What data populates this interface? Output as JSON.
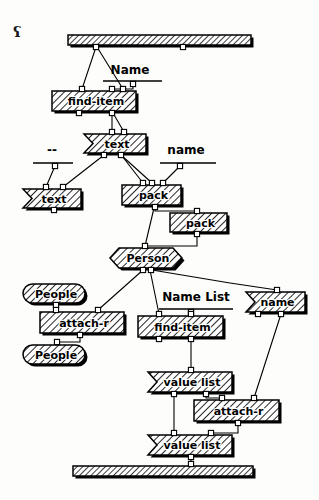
{
  "canvas": {
    "width": 319,
    "height": 500,
    "background": "#fdfdfb",
    "ink": "#000000",
    "corner_mark": "ʕ"
  },
  "diagram": {
    "kind": "visual-dataflow-program",
    "title": "",
    "bars": [
      {
        "id": "top-bar",
        "name": "input-terminal-bar",
        "x": 68,
        "y": 35,
        "w": 183,
        "h": 10
      },
      {
        "id": "bottom-bar",
        "name": "output-terminal-bar",
        "x": 73,
        "y": 466,
        "w": 180,
        "h": 10
      }
    ],
    "nodes": [
      {
        "id": "find-item-1",
        "label": "find-item",
        "shape": "rect",
        "x": 52,
        "y": 91,
        "w": 84,
        "h": 20,
        "font": 11
      },
      {
        "id": "text-1",
        "label": "text",
        "shape": "banner",
        "x": 84,
        "y": 134,
        "w": 62,
        "h": 19,
        "font": 11
      },
      {
        "id": "text-2",
        "label": "text",
        "shape": "banner",
        "x": 23,
        "y": 189,
        "w": 58,
        "h": 19,
        "font": 11
      },
      {
        "id": "pack-1",
        "label": "pack",
        "shape": "rect",
        "x": 122,
        "y": 185,
        "w": 59,
        "h": 20,
        "font": 11
      },
      {
        "id": "pack-2",
        "label": "pack",
        "shape": "rect",
        "x": 170,
        "y": 213,
        "w": 57,
        "h": 19,
        "font": 11
      },
      {
        "id": "person",
        "label": "Person",
        "shape": "hexagon",
        "x": 110,
        "y": 248,
        "w": 72,
        "h": 20,
        "font": 11
      },
      {
        "id": "people-1",
        "label": "People",
        "shape": "oval",
        "x": 23,
        "y": 284,
        "w": 62,
        "h": 19,
        "font": 11
      },
      {
        "id": "attach-r-1",
        "label": "attach-r",
        "shape": "rect",
        "x": 40,
        "y": 312,
        "w": 84,
        "h": 21,
        "font": 11
      },
      {
        "id": "people-2",
        "label": "People",
        "shape": "oval",
        "x": 23,
        "y": 345,
        "w": 62,
        "h": 19,
        "font": 11
      },
      {
        "id": "name-banner",
        "label": "name",
        "shape": "banner",
        "x": 246,
        "y": 292,
        "w": 59,
        "h": 20,
        "font": 11
      },
      {
        "id": "find-item-2",
        "label": "find-item",
        "shape": "rect",
        "x": 138,
        "y": 316,
        "w": 85,
        "h": 21,
        "font": 11
      },
      {
        "id": "value-list-1",
        "label": "value list",
        "shape": "banner",
        "x": 148,
        "y": 372,
        "w": 84,
        "h": 20,
        "font": 11
      },
      {
        "id": "attach-r-2",
        "label": "attach-r",
        "shape": "rect",
        "x": 194,
        "y": 400,
        "w": 85,
        "h": 21,
        "font": 11
      },
      {
        "id": "value-list-2",
        "label": "value list",
        "shape": "banner",
        "x": 148,
        "y": 435,
        "w": 84,
        "h": 20,
        "font": 11
      }
    ],
    "labels": [
      {
        "id": "label-name",
        "text": "Name",
        "x": 130,
        "y": 70,
        "font": 12,
        "rule": {
          "x1": 103,
          "y1": 81,
          "x2": 162,
          "y2": 81
        }
      },
      {
        "id": "label-dashdash",
        "text": "--",
        "x": 52,
        "y": 150,
        "font": 12,
        "rule": {
          "x1": 33,
          "y1": 163,
          "x2": 73,
          "y2": 163
        }
      },
      {
        "id": "label-name-low",
        "text": "name",
        "x": 186,
        "y": 150,
        "font": 12,
        "rule": {
          "x1": 160,
          "y1": 163,
          "x2": 216,
          "y2": 163
        }
      },
      {
        "id": "label-name-list",
        "text": "Name List",
        "x": 196,
        "y": 297,
        "font": 12,
        "rule": {
          "x1": 159,
          "y1": 309,
          "x2": 233,
          "y2": 309
        }
      }
    ],
    "ports": [
      {
        "id": "p-topbar-a",
        "x": 96,
        "y": 47
      },
      {
        "id": "p-topbar-b",
        "x": 183,
        "y": 47
      },
      {
        "id": "p-namerule",
        "x": 133,
        "y": 84
      },
      {
        "id": "p-fi1-in-a",
        "x": 82,
        "y": 89
      },
      {
        "id": "p-fi1-in-b",
        "x": 112,
        "y": 89
      },
      {
        "id": "p-fi1-in-c",
        "x": 123,
        "y": 89
      },
      {
        "id": "p-fi1-out-a",
        "x": 79,
        "y": 113
      },
      {
        "id": "p-fi1-out-b",
        "x": 112,
        "y": 113
      },
      {
        "id": "p-txt1-in-a",
        "x": 112,
        "y": 132
      },
      {
        "id": "p-txt1-in-b",
        "x": 124,
        "y": 132
      },
      {
        "id": "p-txt1-out-a",
        "x": 104,
        "y": 155
      },
      {
        "id": "p-txt1-out-b",
        "x": 121,
        "y": 155
      },
      {
        "id": "p-dash-rule",
        "x": 55,
        "y": 166
      },
      {
        "id": "p-name-rule",
        "x": 180,
        "y": 166
      },
      {
        "id": "p-txt2-in-a",
        "x": 46,
        "y": 187
      },
      {
        "id": "p-txt2-in-b",
        "x": 63,
        "y": 187
      },
      {
        "id": "p-txt2-out",
        "x": 54,
        "y": 210
      },
      {
        "id": "p-pack1-in-a",
        "x": 143,
        "y": 183
      },
      {
        "id": "p-pack1-in-b",
        "x": 152,
        "y": 183
      },
      {
        "id": "p-pack1-in-c",
        "x": 163,
        "y": 183
      },
      {
        "id": "p-pack1-out",
        "x": 155,
        "y": 207
      },
      {
        "id": "p-pack2-in",
        "x": 197,
        "y": 211
      },
      {
        "id": "p-pack2-out",
        "x": 197,
        "y": 234
      },
      {
        "id": "p-person-in",
        "x": 145,
        "y": 246
      },
      {
        "id": "p-person-o-a",
        "x": 143,
        "y": 270
      },
      {
        "id": "p-person-o-b",
        "x": 151,
        "y": 270
      },
      {
        "id": "p-people1-out",
        "x": 56,
        "y": 305
      },
      {
        "id": "p-ar1-in-a",
        "x": 56,
        "y": 310
      },
      {
        "id": "p-ar1-in-b",
        "x": 98,
        "y": 310
      },
      {
        "id": "p-ar1-out",
        "x": 80,
        "y": 335
      },
      {
        "id": "p-people2-in",
        "x": 57,
        "y": 342
      },
      {
        "id": "p-nl-rule",
        "x": 191,
        "y": 312
      },
      {
        "id": "p-fi2-in-a",
        "x": 159,
        "y": 314
      },
      {
        "id": "p-fi2-in-b",
        "x": 191,
        "y": 314
      },
      {
        "id": "p-fi2-out-a",
        "x": 159,
        "y": 339
      },
      {
        "id": "p-fi2-out-b",
        "x": 191,
        "y": 339
      },
      {
        "id": "p-nm-in",
        "x": 277,
        "y": 290
      },
      {
        "id": "p-nm-out-a",
        "x": 258,
        "y": 314
      },
      {
        "id": "p-nm-out-b",
        "x": 281,
        "y": 314
      },
      {
        "id": "p-vl1-in",
        "x": 191,
        "y": 370
      },
      {
        "id": "p-vl1-out-a",
        "x": 174,
        "y": 394
      },
      {
        "id": "p-vl1-out-b",
        "x": 206,
        "y": 394
      },
      {
        "id": "p-ar2-in-a",
        "x": 222,
        "y": 398
      },
      {
        "id": "p-ar2-in-b",
        "x": 254,
        "y": 398
      },
      {
        "id": "p-ar2-out",
        "x": 238,
        "y": 423
      },
      {
        "id": "p-vl2-in-a",
        "x": 174,
        "y": 433
      },
      {
        "id": "p-vl2-in-b",
        "x": 211,
        "y": 433
      },
      {
        "id": "p-vl2-out",
        "x": 191,
        "y": 457
      },
      {
        "id": "p-botbar",
        "x": 191,
        "y": 464
      }
    ],
    "wires": [
      {
        "id": "w1",
        "from": "p-topbar-a",
        "to": "p-fi1-in-a",
        "path": "M96,47 L82,89"
      },
      {
        "id": "w2",
        "from": "p-topbar-a",
        "to": "p-fi1-in-c",
        "path": "M97,47 L123,89"
      },
      {
        "id": "w3",
        "from": "p-namerule",
        "to": "p-fi1-in-b",
        "path": "M133,84 L133,89 L112,89"
      },
      {
        "id": "w4",
        "from": "p-fi1-out-b",
        "to": "p-txt1-in-a",
        "path": "M112,113 L112,132"
      },
      {
        "id": "w5",
        "from": "p-fi1-out-b",
        "to": "p-txt1-in-b",
        "path": "M113,113 L124,132"
      },
      {
        "id": "w6",
        "from": "p-txt1-out-a",
        "to": "p-txt2-in-b",
        "path": "M104,155 L63,187"
      },
      {
        "id": "w7",
        "from": "p-dash-rule",
        "to": "p-txt2-in-a",
        "path": "M55,166 L46,187"
      },
      {
        "id": "w8",
        "from": "p-txt1-out-b",
        "to": "p-pack1-in-b",
        "path": "M121,155 L152,183"
      },
      {
        "id": "w9",
        "from": "p-name-rule",
        "to": "p-pack1-in-c",
        "path": "M180,166 L163,183"
      },
      {
        "id": "w10",
        "from": "p-txt1-out-b",
        "to": "p-pack1-in-a",
        "path": "M122,156 L143,183"
      },
      {
        "id": "w11",
        "from": "p-pack1-out",
        "to": "p-pack2-in",
        "path": "M155,207 L155,211 L197,211"
      },
      {
        "id": "w12",
        "from": "p-pack2-out",
        "to": "p-person-in",
        "path": "M197,234 L197,246 L145,246"
      },
      {
        "id": "w13",
        "from": "p-pack1-out",
        "to": "p-person-in",
        "path": "M154,208 L145,246"
      },
      {
        "id": "w14",
        "from": "p-person-o-a",
        "to": "p-ar1-in-b",
        "path": "M143,270 L98,310"
      },
      {
        "id": "w15",
        "from": "p-person-o-b",
        "to": "p-fi2-in-a",
        "path": "M150,270 L159,314"
      },
      {
        "id": "w16",
        "from": "p-person-o-b",
        "to": "p-nm-in",
        "path": "M152,270 L230,283 L277,290"
      },
      {
        "id": "w17",
        "from": "p-people1-out",
        "to": "p-ar1-in-a",
        "path": "M56,305 L56,310"
      },
      {
        "id": "w18",
        "from": "p-ar1-out",
        "to": "p-people2-in",
        "path": "M80,335 L80,342 L57,342"
      },
      {
        "id": "w19",
        "from": "p-nl-rule",
        "to": "p-fi2-in-b",
        "path": "M191,312 L191,314"
      },
      {
        "id": "w20",
        "from": "p-fi2-out-b",
        "to": "p-vl1-in",
        "path": "M191,339 L191,370"
      },
      {
        "id": "w21",
        "from": "p-nm-out-b",
        "to": "p-ar2-in-b",
        "path": "M281,314 L254,398"
      },
      {
        "id": "w22",
        "from": "p-vl1-out-b",
        "to": "p-ar2-in-a",
        "path": "M206,394 L206,398 L222,398"
      },
      {
        "id": "w23",
        "from": "p-vl1-out-a",
        "to": "p-vl2-in-a",
        "path": "M174,394 L174,433"
      },
      {
        "id": "w24",
        "from": "p-ar2-out",
        "to": "p-vl2-in-b",
        "path": "M238,423 L238,433 L211,433"
      },
      {
        "id": "w25",
        "from": "p-vl2-out",
        "to": "p-botbar",
        "path": "M191,457 L191,464"
      }
    ]
  }
}
